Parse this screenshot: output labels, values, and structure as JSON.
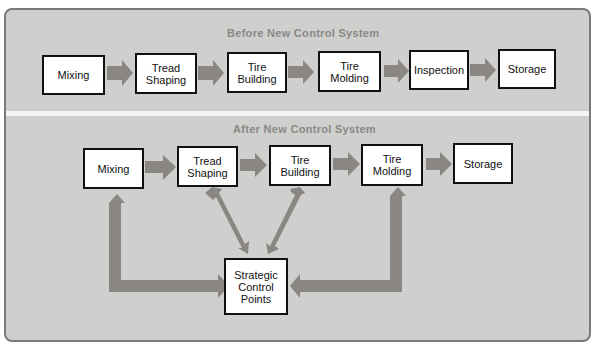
{
  "diagram": {
    "colors": {
      "panel": "#cfcfcd",
      "panel_border": "#7a7a78",
      "arrow": "#8a8683",
      "box_fill": "#ffffff",
      "box_border": "#111111",
      "title_text": "#8a8886"
    },
    "before": {
      "title": "Before New Control System",
      "steps": [
        {
          "label_line1": "Mixing",
          "label_line2": ""
        },
        {
          "label_line1": "Tread",
          "label_line2": "Shaping"
        },
        {
          "label_line1": "Tire",
          "label_line2": "Building"
        },
        {
          "label_line1": "Tire",
          "label_line2": "Molding"
        },
        {
          "label_line1": "Inspection",
          "label_line2": ""
        },
        {
          "label_line1": "Storage",
          "label_line2": ""
        }
      ]
    },
    "after": {
      "title": "After New Control System",
      "steps": [
        {
          "label_line1": "Mixing",
          "label_line2": ""
        },
        {
          "label_line1": "Tread",
          "label_line2": "Shaping"
        },
        {
          "label_line1": "Tire",
          "label_line2": "Building"
        },
        {
          "label_line1": "Tire",
          "label_line2": "Molding"
        },
        {
          "label_line1": "Storage",
          "label_line2": ""
        }
      ],
      "control_hub": {
        "label_line1": "Strategic",
        "label_line2": "Control",
        "label_line3": "Points"
      },
      "connections": [
        {
          "from": "Mixing",
          "to": "Strategic Control Points",
          "type": "bidirectional-elbow"
        },
        {
          "from": "Tread Shaping",
          "to": "Strategic Control Points",
          "type": "bidirectional-diagonal"
        },
        {
          "from": "Tire Building",
          "to": "Strategic Control Points",
          "type": "bidirectional-diagonal"
        },
        {
          "from": "Tire Molding",
          "to": "Strategic Control Points",
          "type": "bidirectional-elbow"
        }
      ]
    }
  }
}
